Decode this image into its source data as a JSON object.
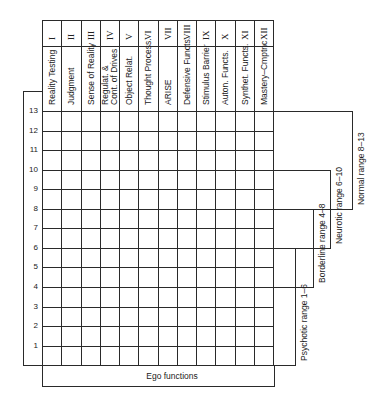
{
  "table": {
    "columns": [
      {
        "numeral": "I",
        "label": "Reality Testing"
      },
      {
        "numeral": "II",
        "label": "Judgment"
      },
      {
        "numeral": "III",
        "label": "Sense of Reality"
      },
      {
        "numeral": "IV",
        "label": "Regulat. &\nCont. of Drives",
        "label_lines": [
          "Regulat. &",
          "Cont. of Drives"
        ]
      },
      {
        "numeral": "V",
        "label": "Object Relat."
      },
      {
        "numeral": "VI",
        "label": "Thought Process."
      },
      {
        "numeral": "VII",
        "label": "ARISE"
      },
      {
        "numeral": "VIII",
        "label": "Defensive Functs."
      },
      {
        "numeral": "IX",
        "label": "Stimulus Barrier"
      },
      {
        "numeral": "X",
        "label": "Auton. Functs."
      },
      {
        "numeral": "XI",
        "label": "Synthet. Functs."
      },
      {
        "numeral": "XII",
        "label": "Mastery–Cmptnc"
      }
    ],
    "rows": [
      "13",
      "12",
      "11",
      "10",
      "9",
      "8",
      "7",
      "6",
      "5",
      "4",
      "3",
      "2",
      "1"
    ],
    "footer_label": "Ego functions"
  },
  "ranges": [
    {
      "label": "Normal range 8–13",
      "from": 8,
      "to": 13
    },
    {
      "label": "Neurotic range 6–10",
      "from": 6,
      "to": 10
    },
    {
      "label": "Borderline range 4–8",
      "from": 4,
      "to": 8
    },
    {
      "label": "Psychotic range 1–6",
      "from": 1,
      "to": 6
    }
  ]
}
